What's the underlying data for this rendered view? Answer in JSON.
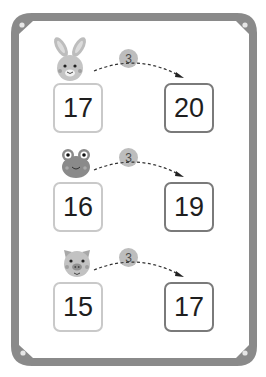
{
  "worksheet": {
    "frame_color": "#8a8a8a",
    "rows": [
      {
        "animal": "rabbit",
        "start": "17",
        "step": "3",
        "end": "20"
      },
      {
        "animal": "frog",
        "start": "16",
        "step": "3",
        "end": "19"
      },
      {
        "animal": "pig",
        "start": "15",
        "step": "3",
        "end": "17"
      }
    ]
  }
}
